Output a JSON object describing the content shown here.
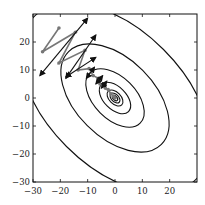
{
  "chart_data": {
    "type": "contour",
    "title": "",
    "xlabel": "",
    "ylabel": "",
    "xlim": [
      -30,
      30
    ],
    "ylim": [
      -30,
      30
    ],
    "grid": false,
    "xticks": [
      "−30",
      "−20",
      "−10",
      "0",
      "10",
      "20"
    ],
    "yticks": [
      "−30",
      "−20",
      "−10",
      "0",
      "10",
      "20"
    ],
    "xtick_values": [
      -30,
      -20,
      -10,
      0,
      10,
      20
    ],
    "ytick_values": [
      -30,
      -20,
      -10,
      0,
      10,
      20
    ],
    "contours": {
      "center": [
        0,
        0
      ],
      "description": "Elliptical level sets of a quadratic, major axis tilted along the anti-diagonal (upper-left to lower-right)",
      "semi_axes": [
        [
          1.2,
          0.7
        ],
        [
          2.2,
          1.3
        ],
        [
          3.5,
          2.1
        ],
        [
          7,
          4
        ],
        [
          13,
          7.5
        ],
        [
          24,
          14
        ],
        [
          42,
          24.5
        ],
        [
          75,
          44
        ]
      ],
      "rotation_deg": -45
    },
    "path": {
      "name": "gradient descent iterates",
      "color": "#777777",
      "points": [
        [
          -20.5,
          25
        ],
        [
          -26.5,
          16.5
        ],
        [
          -14.5,
          23.5
        ],
        [
          -20.5,
          12.5
        ],
        [
          -11,
          17
        ],
        [
          -13.5,
          10
        ],
        [
          -9.5,
          10.5
        ],
        [
          -8,
          8
        ],
        [
          -6,
          7
        ],
        [
          -5.5,
          5
        ],
        [
          -4,
          5
        ],
        [
          -3.5,
          3.5
        ],
        [
          -2.5,
          3
        ],
        [
          -1.5,
          1.5
        ],
        [
          -0.5,
          0.5
        ],
        [
          0,
          0
        ]
      ]
    },
    "arrows": {
      "color": "#111111",
      "description": "Black double-headed arrows perpendicular to the descent direction at each iterate",
      "segments": [
        [
          [
            -27.5,
            8
          ],
          [
            -10,
            28.5
          ]
        ],
        [
          [
            -18,
            7
          ],
          [
            -7,
            22.5
          ]
        ],
        [
          [
            -18,
            7.5
          ],
          [
            -7,
            14.5
          ]
        ],
        [
          [
            -10.5,
            7
          ],
          [
            -7.5,
            11
          ]
        ],
        [
          [
            -7,
            5
          ],
          [
            -4.5,
            8
          ]
        ],
        [
          [
            -5,
            3.5
          ],
          [
            -3,
            6
          ]
        ]
      ]
    }
  }
}
